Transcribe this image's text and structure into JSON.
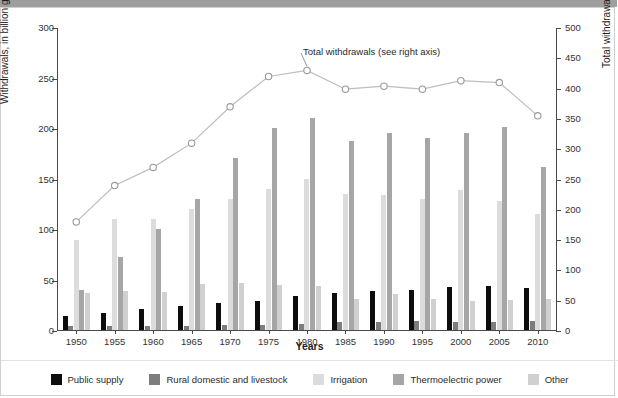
{
  "axes": {
    "x_title": "Years",
    "y_left_title": "Withdrawals, in billion gallons per day",
    "y_right_title": "Total withdrawals, in billion gallons per day"
  },
  "annotation": {
    "text": "Total withdrawals  (see right axis)"
  },
  "legend": {
    "items": [
      {
        "label": "Public supply",
        "color": "#0d0d0d"
      },
      {
        "label": "Rural domestic and livestock",
        "color": "#7d7d7d"
      },
      {
        "label": "Irrigation",
        "color": "#dcdcdc"
      },
      {
        "label": "Thermoelectric power",
        "color": "#a6a6a6"
      },
      {
        "label": "Other",
        "color": "#d0d0d0"
      }
    ]
  },
  "chart_data": {
    "type": "bar",
    "title": "",
    "xlabel": "Years",
    "ylabel": "Withdrawals, in billion gallons per day",
    "y2label": "Total withdrawals, in billion gallons per day",
    "ylim": [
      0,
      300
    ],
    "y2lim": [
      0,
      500
    ],
    "yticks": [
      0,
      50,
      100,
      150,
      200,
      250,
      300
    ],
    "y2ticks": [
      0,
      50,
      100,
      150,
      200,
      250,
      300,
      350,
      400,
      450,
      500
    ],
    "grid": false,
    "legend_position": "bottom",
    "categories": [
      "1950",
      "1955",
      "1960",
      "1965",
      "1970",
      "1975",
      "1980",
      "1985",
      "1990",
      "1995",
      "2000",
      "2005",
      "2010"
    ],
    "series": [
      {
        "name": "Public supply",
        "color": "#0d0d0d",
        "axis": "left",
        "values": [
          14,
          17,
          21,
          24,
          27,
          29,
          34,
          37,
          39,
          40,
          43,
          44,
          42
        ]
      },
      {
        "name": "Rural domestic and livestock",
        "color": "#7d7d7d",
        "axis": "left",
        "values": [
          3.6,
          3.6,
          3.6,
          4.0,
          4.5,
          4.9,
          5.6,
          7.8,
          7.9,
          8.9,
          8.2,
          8.4,
          8.6
        ]
      },
      {
        "name": "Irrigation",
        "color": "#dcdcdc",
        "axis": "left",
        "values": [
          89,
          110,
          110,
          120,
          130,
          140,
          150,
          135,
          134,
          130,
          139,
          128,
          115
        ]
      },
      {
        "name": "Thermoelectric power",
        "color": "#a6a6a6",
        "axis": "left",
        "values": [
          40,
          72,
          100,
          130,
          170,
          200,
          210,
          187,
          195,
          190,
          195,
          201,
          161
        ]
      },
      {
        "name": "Other",
        "color": "#d0d0d0",
        "axis": "left",
        "values": [
          37,
          39,
          38,
          46,
          47,
          45,
          44,
          31,
          36,
          31,
          29,
          30,
          31
        ]
      }
    ],
    "line_series": {
      "name": "Total withdrawals",
      "axis": "right",
      "marker": "open-circle",
      "color": "#bdbdbd",
      "values": [
        180,
        240,
        270,
        310,
        370,
        420,
        430,
        399,
        404,
        399,
        413,
        410,
        355
      ]
    }
  }
}
